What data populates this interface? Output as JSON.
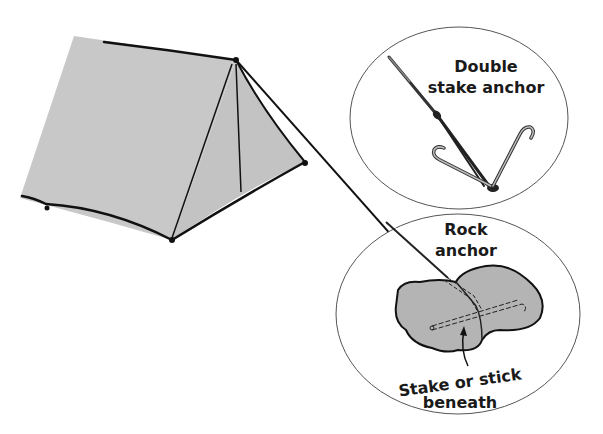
{
  "diagram": {
    "colors": {
      "tent_fill": "#c8c8c8",
      "rock_fill": "#b4b4b4",
      "outline": "#111111",
      "ellipse_stroke": "#555555",
      "background": "#ffffff"
    },
    "callouts": [
      {
        "id": "double-stake",
        "title_line1": "Double",
        "title_line2": "stake anchor"
      },
      {
        "id": "rock",
        "title_line1": "Rock",
        "title_line2": "anchor",
        "annotation_line1": "Stake or stick",
        "annotation_line2": "beneath"
      }
    ]
  }
}
